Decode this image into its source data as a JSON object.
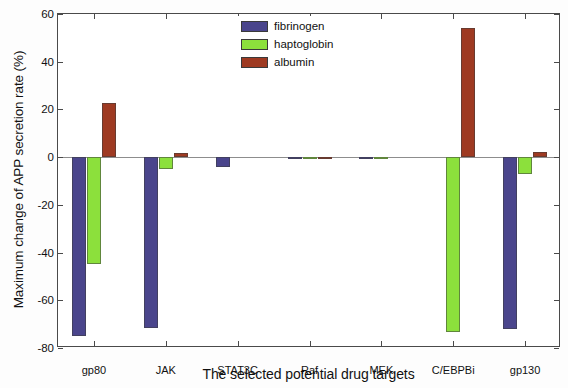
{
  "chart_data": {
    "type": "bar",
    "title": "",
    "xlabel": "The selected potential drug targets",
    "ylabel": "Maximum change of APP secretion rate (%)",
    "categories": [
      "gp80",
      "JAK",
      "STAT3C",
      "Raf",
      "MEK",
      "C/EBPBi",
      "gp130"
    ],
    "series": [
      {
        "name": "fibrinogen",
        "color": "#4a458c",
        "values": [
          -75.0,
          -71.5,
          -4.0,
          -0.5,
          -0.3,
          0.0,
          -72.0
        ]
      },
      {
        "name": "haptoglobin",
        "color": "#8ce03c",
        "values": [
          -45.0,
          -5.0,
          0.0,
          -0.3,
          -0.2,
          -73.5,
          -7.0
        ]
      },
      {
        "name": "albumin",
        "color": "#9e3a22",
        "values": [
          22.8,
          1.8,
          0.0,
          -0.3,
          0.0,
          54.0,
          2.0
        ]
      }
    ],
    "ylim": [
      -80,
      60
    ],
    "yticks": [
      60,
      40,
      20,
      0,
      -20,
      -40,
      -60,
      -80
    ],
    "ytick_labels": [
      "60",
      "40",
      "20",
      "0",
      "-20",
      "-40",
      "-60",
      "-80"
    ],
    "grid": false,
    "zero_line": true,
    "legend_position": "top-center",
    "legend_entries": [
      "fibrinogen",
      "haptoglobin",
      "albumin"
    ]
  },
  "axes": {
    "y_title": "Maximum change of APP secretion rate (%)",
    "x_title": "The selected potential drug targets"
  },
  "legend": {
    "items": [
      {
        "label": "fibrinogen",
        "color": "#4a458c"
      },
      {
        "label": "haptoglobin",
        "color": "#8ce03c"
      },
      {
        "label": "albumin",
        "color": "#9e3a22"
      }
    ]
  }
}
